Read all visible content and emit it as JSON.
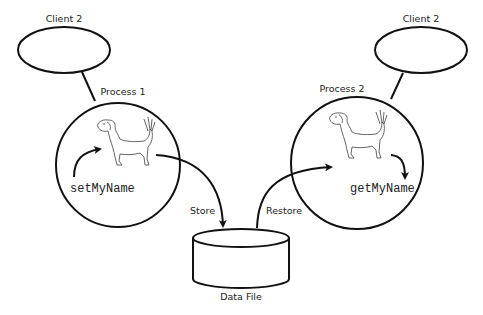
{
  "diagram": {
    "clients": [
      {
        "label": "Client 2"
      },
      {
        "label": "Client 2"
      }
    ],
    "processes": [
      {
        "label": "Process 1",
        "method": "setMyName",
        "icon": "dog-icon"
      },
      {
        "label": "Process 2",
        "method": "getMyName",
        "icon": "dog-icon"
      }
    ],
    "edges": [
      {
        "label": "Store",
        "from": "Process 1",
        "to": "Data File"
      },
      {
        "label": "Restore",
        "from": "Data File",
        "to": "Process 2"
      }
    ],
    "storage": {
      "label": "Data File",
      "icon": "database-cylinder-icon"
    }
  }
}
